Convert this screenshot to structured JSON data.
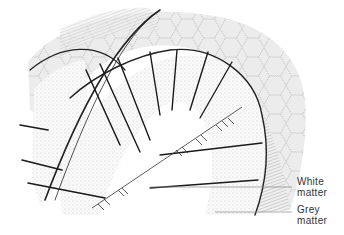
{
  "diagram": {
    "labels": {
      "white_matter_line1": "White",
      "white_matter_line2": "matter",
      "grey_matter_line1": "Grey",
      "grey_matter_line2": "matter"
    },
    "colors": {
      "ink": "#222222",
      "stipple": "#bdbdbd",
      "pia_fill": "#e6e6e6",
      "background": "#ffffff"
    }
  }
}
